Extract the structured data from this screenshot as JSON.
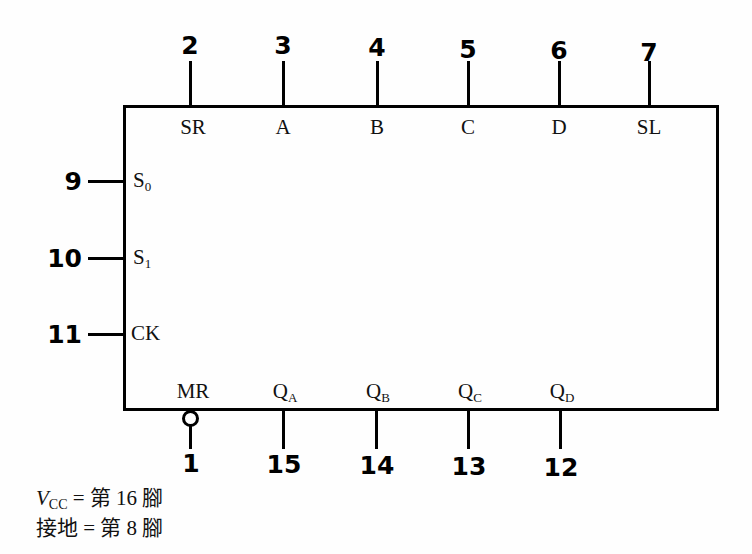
{
  "diagram": {
    "chip_outline": {
      "x": 123,
      "y": 105,
      "width": 596,
      "height": 306,
      "stroke_color": "#000000",
      "stroke_width": 3
    },
    "background_color": "#fefefe",
    "line_color": "#000000"
  },
  "top_pins": [
    {
      "number": "2",
      "label": "SR",
      "label_sub": "",
      "x": 190
    },
    {
      "number": "3",
      "label": "A",
      "label_sub": "",
      "x": 283
    },
    {
      "number": "4",
      "label": "B",
      "label_sub": "",
      "x": 377
    },
    {
      "number": "5",
      "label": "C",
      "label_sub": "",
      "x": 468
    },
    {
      "number": "6",
      "label": "D",
      "label_sub": "",
      "x": 559
    },
    {
      "number": "7",
      "label": "SL",
      "label_sub": "",
      "x": 649
    }
  ],
  "left_pins": [
    {
      "number": "9",
      "label": "S",
      "label_sub": "0",
      "y": 180
    },
    {
      "number": "10",
      "label": "S",
      "label_sub": "1",
      "y": 257
    },
    {
      "number": "11",
      "label": "CK",
      "label_sub": "",
      "y": 333
    }
  ],
  "bottom_pins": [
    {
      "number": "1",
      "label": "MR",
      "label_sub": "",
      "x": 191,
      "inverted": true
    },
    {
      "number": "15",
      "label": "Q",
      "label_sub": "A",
      "x": 283,
      "inverted": false
    },
    {
      "number": "14",
      "label": "Q",
      "label_sub": "B",
      "x": 376,
      "inverted": false
    },
    {
      "number": "13",
      "label": "Q",
      "label_sub": "C",
      "x": 468,
      "inverted": false
    },
    {
      "number": "12",
      "label": "Q",
      "label_sub": "D",
      "x": 560,
      "inverted": false
    }
  ],
  "caption": {
    "line1_prefix": "V",
    "line1_sub": "CC",
    "line1_rest": " = 第 16 腳",
    "line2": "接地 = 第 8 腳"
  }
}
